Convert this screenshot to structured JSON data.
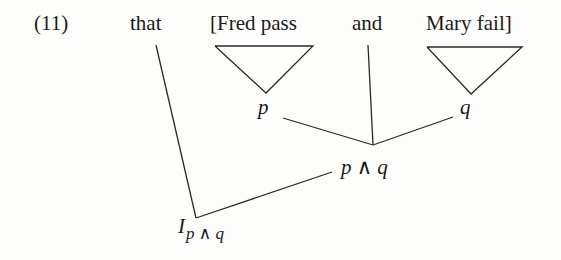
{
  "example": {
    "number": "(11)",
    "words": {
      "that": "that",
      "fred_pass": "[Fred pass",
      "and": "and",
      "mary_fail": "Mary fail]"
    },
    "nodes": {
      "p": "p",
      "q": "q",
      "p_and_q": "p ∧ q",
      "I": "I",
      "I_subscript": "p ∧ q"
    }
  }
}
